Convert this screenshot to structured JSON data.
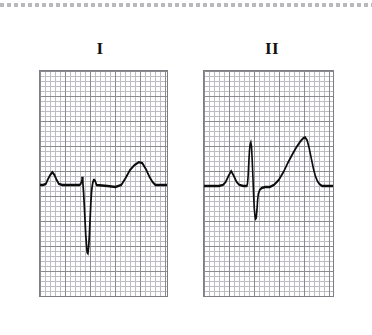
{
  "figure": {
    "kind": "electrocardiogram-strip",
    "background_color": "#ffffff",
    "top_artifact": {
      "name": "dashed-scan-line",
      "color": "#b9b9bd"
    }
  },
  "panels": [
    {
      "id": "I",
      "label": "I",
      "grid": {
        "minor_cell_px": 5,
        "major_cell_px": 25,
        "minor_color": "#bcbcc2",
        "major_color": "#8a8a8f",
        "border_color": "#7d7d83",
        "columns_minor": 26,
        "rows_minor": 45
      },
      "trace": {
        "color": "#0d0d0d",
        "stroke_width": 2.4,
        "baseline_y": 115,
        "morphology": "qS complex with deep negative deflection, upright P wave, upright T wave",
        "points": "0,115 4,115 8,114 11,109 14,105 17,102 20,105 23,110 26,114 31,115 45,115 54,115 56,114 57,112 58,110 58,108 59,108 59,112 60,122 61,135 62,150 63,165 64,175 65,183 66,184 67,178 68,166 69,150 70,134 71,122 72,116 73,112 74,110 75,110 76,111 77,113 78,115 93,116 104,117 112,115 118,108 124,100 130,95 136,92 141,93 146,99 151,107 155,112 159,115 165,115 175,115"
      },
      "features": [
        {
          "name": "p-wave",
          "polarity": "positive"
        },
        {
          "name": "q-notch",
          "polarity": "small"
        },
        {
          "name": "s-wave",
          "polarity": "deep-negative"
        },
        {
          "name": "t-wave",
          "polarity": "positive"
        }
      ]
    },
    {
      "id": "II",
      "label": "II",
      "grid": {
        "minor_cell_px": 5,
        "major_cell_px": 25,
        "minor_color": "#bcbcc2",
        "major_color": "#8a8a8f",
        "border_color": "#7d7d83",
        "columns_minor": 26,
        "rows_minor": 45
      },
      "trace": {
        "color": "#0d0d0d",
        "stroke_width": 2.4,
        "baseline_y": 116,
        "morphology": "qRs complex with tall R wave, negative S wave, tall broad T wave",
        "points": "0,116 10,116 22,116 28,115 32,112 36,106 40,101 44,106 48,112 52,115 58,116 63,116 64,114 65,106 66,92 67,80 68,74 69,72 70,76 71,90 72,106 73,124 74,138 75,146 76,149 77,148 78,140 79,130 80,124 82,120 85,118 90,117 97,117 103,115 110,110 117,102 124,92 131,83 137,76 142,71 146,68 149,67 152,70 155,78 158,88 161,98 164,106 167,111 170,114 174,116 180,116 190,116"
      },
      "features": [
        {
          "name": "p-wave",
          "polarity": "positive"
        },
        {
          "name": "r-wave",
          "polarity": "tall-positive"
        },
        {
          "name": "s-wave",
          "polarity": "negative"
        },
        {
          "name": "t-wave",
          "polarity": "tall-positive"
        }
      ]
    }
  ]
}
